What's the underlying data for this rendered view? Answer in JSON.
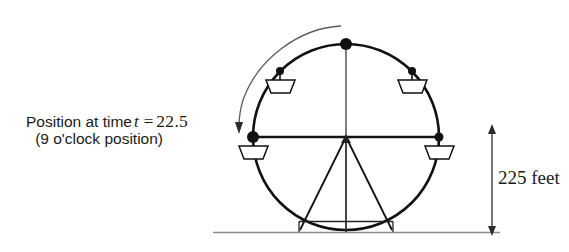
{
  "figure": {
    "background_color": "#ffffff",
    "line_color": "#111111",
    "ground_color": "#8c8c8c",
    "arc_arrow_color": "#555555"
  },
  "annotations": {
    "position_label": {
      "line1_prefix": "Position at time",
      "variable": "t",
      "equals": "=",
      "value": "22.5",
      "line2": "(9 o'clock position)"
    },
    "height_label": {
      "text": "225 feet",
      "value": 225,
      "unit": "feet"
    }
  },
  "wheel": {
    "center_x": 346,
    "center_y": 137,
    "radius": 93,
    "rotation_direction": "counterclockwise",
    "hub_points": [
      {
        "name": "top-12-oclock",
        "x": 346,
        "y": 44,
        "size": "large",
        "has_car": false
      },
      {
        "name": "left-9-oclock",
        "x": 253,
        "y": 137,
        "size": "large",
        "has_car": true
      },
      {
        "name": "right-3-oclock",
        "x": 439,
        "y": 137,
        "size": "small",
        "has_car": true
      },
      {
        "name": "upper-left-10-30",
        "x": 280,
        "y": 71,
        "size": "small",
        "has_car": true
      },
      {
        "name": "upper-right-1-30",
        "x": 412,
        "y": 71,
        "size": "small",
        "has_car": true
      }
    ]
  },
  "ground": {
    "y": 232,
    "x_start": 213,
    "x_end": 500
  },
  "base": {
    "left_x": 300,
    "right_x": 392,
    "top_y": 222,
    "bottom_y": 232
  }
}
